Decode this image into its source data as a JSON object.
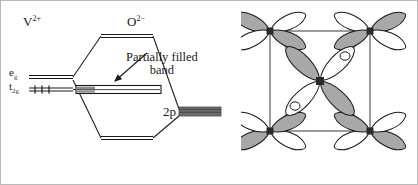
{
  "figure": {
    "background_color": "#ffffff",
    "border_color": "#b9b9b9"
  },
  "mo_diagram": {
    "name": "energy-level-band-diagram",
    "cation_label": "V",
    "cation_charge": "2+",
    "anion_label": "O",
    "anion_charge": "2−",
    "eg_label": "e",
    "eg_subscript": "g",
    "t2g_label": "t",
    "t2g_subscript": "2g",
    "oxygen_level_label": "2p",
    "annotation_line1": "Partially filled",
    "annotation_line2": "band",
    "electron_count": 3,
    "levels": {
      "antibonding_top": "antibonding-level",
      "partially_filled_band": "partially-filled-band",
      "bonding_bottom": "bonding-level"
    },
    "colors": {
      "line": "#1a1a1a",
      "band_fill": "#808080",
      "band_outline": "#1a1a1a",
      "level_2p_fill": "#6e6e6e"
    }
  },
  "lattice_diagram": {
    "name": "d-orbital-lattice-cell",
    "cell_type": "square unit cell, corner atoms plus body-centre atom",
    "corner_atom_count": 4,
    "centre_atom_count": 1,
    "lobes_per_corner_atom": 4,
    "lobes_per_centre_atom": 4,
    "colors": {
      "lobe_filled": "#a8a8a8",
      "lobe_empty": "#ffffff",
      "outline": "#1a1a1a",
      "atom_node": "#2b2b2b",
      "cell_edge": "#4a4a4a"
    }
  }
}
